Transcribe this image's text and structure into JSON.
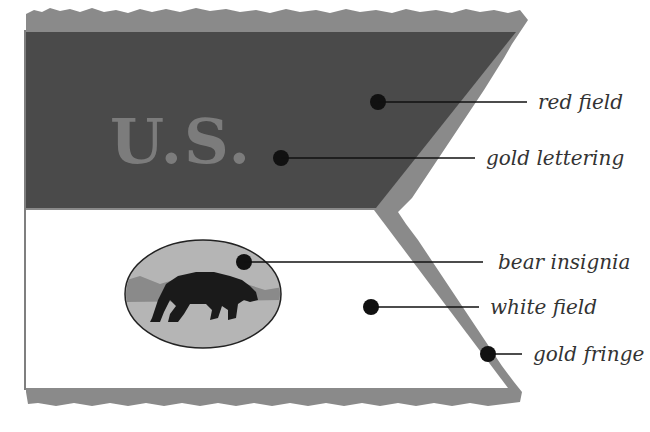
{
  "flag": {
    "lettering": "U.S.",
    "colors": {
      "red_field": "#4a4a4a",
      "gold": "#8a8a8a",
      "gold_lettering": "#7c7c7c",
      "white_field": "#ffffff",
      "insignia_bg": "#b5b5b5",
      "insignia_band": "#888888",
      "bear": "#1a1a1a",
      "callout": "#111111"
    }
  },
  "callouts": [
    {
      "label": "red field"
    },
    {
      "label": "gold lettering"
    },
    {
      "label": "bear insignia"
    },
    {
      "label": "white field"
    },
    {
      "label": "gold fringe"
    }
  ]
}
